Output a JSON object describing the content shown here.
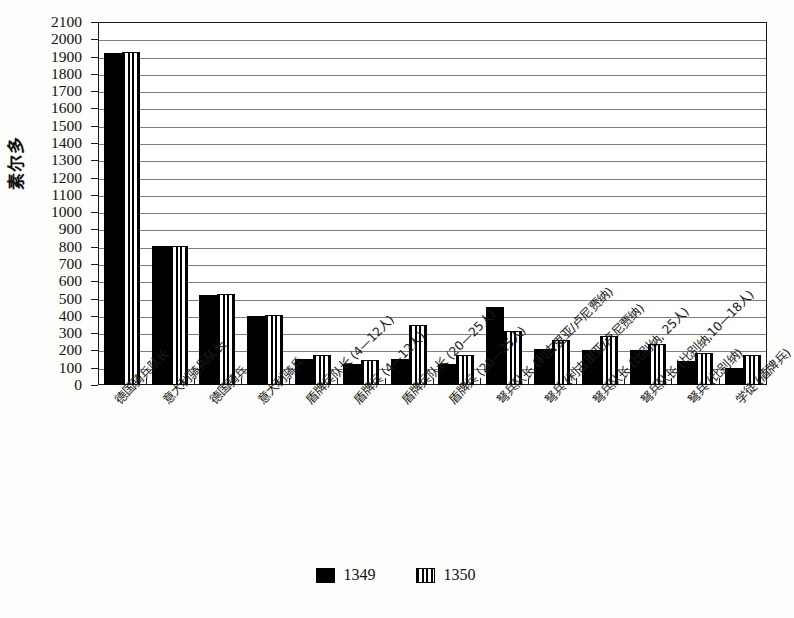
{
  "chart_data": {
    "type": "bar",
    "title": "",
    "xlabel": "",
    "ylabel": "素尔多",
    "ylim": [
      0,
      2100
    ],
    "ytick_step": 100,
    "grid": true,
    "legend_position": "bottom",
    "categories": [
      "德国骑兵队长",
      "意大利骑兵队长",
      "德国骑兵",
      "意大利骑兵",
      "盾牌兵队长 (4—12人)",
      "盾牌兵 (4—12人)",
      "盾牌兵队长 (20—25人)",
      "盾牌兵 (20—25人)",
      "弩兵队长 (利古里亚/卢尼贾纳)",
      "弩兵 (利古里亚/卢尼贾纳)",
      "弩兵队长 (比别纳, 25人)",
      "弩兵队长 (比别纳,10—18人)",
      "弩兵 (比别纳)",
      "学徒 (盾牌兵)"
    ],
    "series": [
      {
        "name": "1349",
        "color": "#000000",
        "values": [
          1920,
          805,
          520,
          400,
          150,
          120,
          150,
          120,
          450,
          210,
          205,
          205,
          140,
          100
        ]
      },
      {
        "name": "1350",
        "color": "#000000",
        "values": [
          1925,
          805,
          527,
          405,
          175,
          145,
          345,
          175,
          315,
          260,
          285,
          235,
          187,
          173
        ]
      }
    ],
    "ytick_labels": [
      "0",
      "100",
      "200",
      "300",
      "400",
      "500",
      "600",
      "700",
      "800",
      "900",
      "1000",
      "1100",
      "1200",
      "1300",
      "1400",
      "1500",
      "1600",
      "1700",
      "1800",
      "1900",
      "2000",
      "2100"
    ]
  },
  "legend": {
    "items": [
      {
        "label": "1349",
        "pattern": "solid-black"
      },
      {
        "label": "1350",
        "pattern": "vertical-stripes"
      }
    ]
  }
}
